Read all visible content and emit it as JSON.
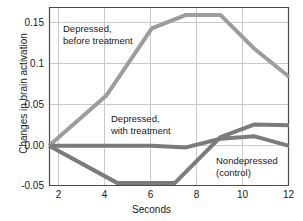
{
  "chart_data": {
    "type": "line",
    "title": "",
    "subtitle": "",
    "xlabel": "Seconds",
    "ylabel": "Changes in brain activation",
    "xlim": [
      1.5,
      12
    ],
    "ylim": [
      -0.05,
      0.175
    ],
    "xticks": [
      2,
      4,
      6,
      8,
      10,
      12
    ],
    "xtick_labels": [
      "2",
      "4",
      "6",
      "8",
      "10",
      "12"
    ],
    "yticks": [
      -0.05,
      0.0,
      0.05,
      0.1,
      0.15
    ],
    "ytick_labels": [
      "-0.05",
      "0.00",
      "0.05",
      "0.1",
      "0.15"
    ],
    "grid": true,
    "legend_position": "inline-annotations",
    "series": [
      {
        "name": "Depressed, before treatment",
        "color": "#9d9d9d",
        "x": [
          1.5,
          4.0,
          6.0,
          7.5,
          9.0,
          10.5,
          12.0
        ],
        "values": [
          0.0,
          0.063,
          0.148,
          0.165,
          0.165,
          0.122,
          0.087
        ]
      },
      {
        "name": "Depressed, with treatment",
        "color": "#7b7b7b",
        "x": [
          1.5,
          6.0,
          7.5,
          9.0,
          10.5,
          12.0
        ],
        "values": [
          0.0,
          0.0,
          -0.002,
          0.009,
          0.012,
          0.0
        ]
      },
      {
        "name": "Nondepressed (control)",
        "color": "#7b7b7b",
        "x": [
          1.5,
          4.5,
          6.0,
          7.0,
          9.0,
          10.5,
          12.0
        ],
        "values": [
          0.0,
          -0.047,
          -0.047,
          -0.047,
          0.011,
          0.027,
          0.026
        ]
      }
    ],
    "annotations": [
      {
        "text_line1": "Depressed,",
        "text_line2": "before treatment",
        "x": 3.2,
        "y": 0.135
      },
      {
        "text_line1": "Depressed,",
        "text_line2": "with treatment",
        "x": 5.6,
        "y": 0.04
      },
      {
        "text_line1": "Nondepressed",
        "text_line2": "(control)",
        "x": 8.8,
        "y": -0.018
      }
    ]
  },
  "axes": {
    "ytick_0": "0.15",
    "ytick_1": "0.1",
    "ytick_2": "0.05",
    "ytick_3": "0.00",
    "ytick_4": "-0.05",
    "xtick_0": "2",
    "xtick_1": "4",
    "xtick_2": "6",
    "xtick_3": "8",
    "xtick_4": "10",
    "xtick_5": "12",
    "xlabel": "Seconds",
    "ylabel": "Changes in brain activation"
  },
  "annotations": {
    "before_treatment_line1": "Depressed,",
    "before_treatment_line2": "before treatment",
    "with_treatment_line1": "Depressed,",
    "with_treatment_line2": "with treatment",
    "control_line1": "Nondepressed",
    "control_line2": "(control)"
  }
}
